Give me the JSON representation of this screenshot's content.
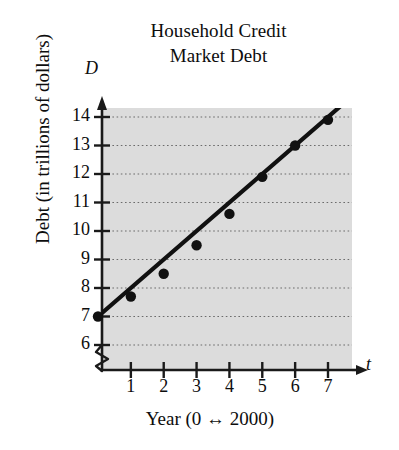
{
  "chart_data": {
    "type": "scatter",
    "title": "Household Credit Market Debt",
    "title_line1": "Household Credit",
    "title_line2": "Market Debt",
    "xlabel": "Year (0 ↔ 2000)",
    "ylabel": "Debt (in trillions of dollars)",
    "x_axis_name": "t",
    "y_axis_name": "D",
    "x": [
      0,
      1,
      2,
      3,
      4,
      5,
      6,
      7
    ],
    "values": [
      7.0,
      7.7,
      8.5,
      9.5,
      10.6,
      11.9,
      13.0,
      13.9
    ],
    "series": [
      {
        "name": "Household credit market debt",
        "points": [
          {
            "t": 0,
            "D": 7.0
          },
          {
            "t": 1,
            "D": 7.7
          },
          {
            "t": 2,
            "D": 8.5
          },
          {
            "t": 3,
            "D": 9.5
          },
          {
            "t": 4,
            "D": 10.6
          },
          {
            "t": 5,
            "D": 11.9
          },
          {
            "t": 6,
            "D": 13.0
          },
          {
            "t": 7,
            "D": 13.9
          }
        ]
      }
    ],
    "trendline": {
      "type": "line",
      "from": {
        "t": -0.15,
        "D": 6.85
      },
      "to": {
        "t": 7.6,
        "D": 14.6
      }
    },
    "xticks": [
      1,
      2,
      3,
      4,
      5,
      6,
      7
    ],
    "xtick_labels": [
      "1",
      "2",
      "3",
      "4",
      "5",
      "6",
      "7"
    ],
    "yticks": [
      6,
      7,
      8,
      9,
      10,
      11,
      12,
      13,
      14
    ],
    "ytick_labels": [
      "6",
      "7",
      "8",
      "9",
      "10",
      "11",
      "12",
      "13",
      "14"
    ],
    "xlim": [
      -0.3,
      8.0
    ],
    "ylim": [
      5.6,
      14.9
    ],
    "grid": "horizontal-dotted",
    "y_axis_break": true,
    "legend": "none",
    "plot_background": "#dcdcdc",
    "marker_color": "#111111",
    "line_color": "#111111",
    "axis_color": "#1a1a1a"
  }
}
